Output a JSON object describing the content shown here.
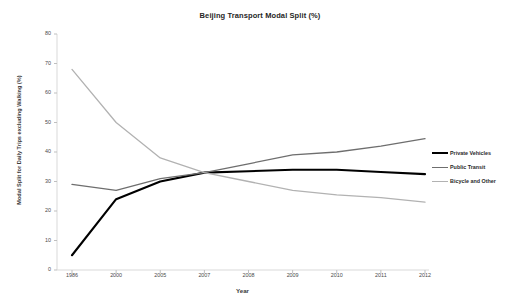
{
  "chart_data": {
    "type": "line",
    "title": "Beijing Transport Modal Split (%)",
    "xlabel": "Year",
    "ylabel": "Modal Split for Daily Trips excluding Walking (%)",
    "categories": [
      "1986",
      "2000",
      "2005",
      "2007",
      "2008",
      "2009",
      "2010",
      "2011",
      "2012"
    ],
    "ylim": [
      0,
      80
    ],
    "yticks": [
      0,
      10,
      20,
      30,
      40,
      50,
      60,
      70,
      80
    ],
    "grid": false,
    "legend_position": "right",
    "series": [
      {
        "name": "Private Vehicles",
        "color": "#000000",
        "width": 2.1,
        "values": [
          5,
          24,
          30,
          33,
          33.5,
          34,
          34,
          33.2,
          32.5
        ]
      },
      {
        "name": "Public Transit",
        "color": "#6e6e6e",
        "width": 1.3,
        "values": [
          29,
          27,
          31,
          33,
          36,
          39,
          40,
          42,
          44.5
        ]
      },
      {
        "name": "Bicycle and Other",
        "color": "#b2b2b2",
        "width": 1.3,
        "values": [
          68,
          50,
          38,
          33,
          30,
          27,
          25.5,
          24.5,
          23
        ]
      }
    ]
  },
  "axis": {
    "line_color": "#d9d9d9",
    "tick_color": "#bfbfbf"
  },
  "legend": {
    "items": [
      {
        "label": "Private Vehicles"
      },
      {
        "label": "Public Transit"
      },
      {
        "label": "Bicycle and Other"
      }
    ]
  }
}
